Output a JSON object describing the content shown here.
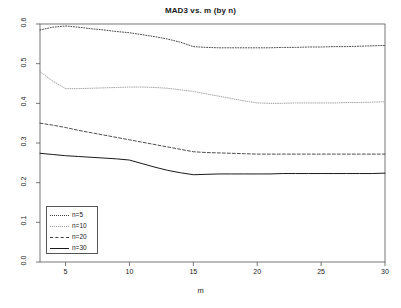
{
  "chart_data": {
    "type": "line",
    "title": "MAD3 vs. m (by n)",
    "xlabel": "m",
    "ylabel": "",
    "xlim": [
      3,
      30
    ],
    "ylim": [
      0.0,
      0.6
    ],
    "grid": false,
    "legend_position": "bottom-left",
    "xticks": [
      "5",
      "10",
      "15",
      "20",
      "25",
      "30"
    ],
    "xtick_values": [
      5,
      10,
      15,
      20,
      25,
      30
    ],
    "yticks": [
      "0.0",
      "0.1",
      "0.2",
      "0.3",
      "0.4",
      "0.5",
      "0.6"
    ],
    "ytick_values": [
      0.0,
      0.1,
      0.2,
      0.3,
      0.4,
      0.5,
      0.6
    ],
    "x": [
      3,
      4,
      5,
      6,
      7,
      8,
      9,
      10,
      11,
      12,
      13,
      14,
      15,
      16,
      17,
      18,
      19,
      20,
      21,
      22,
      23,
      24,
      25,
      26,
      27,
      28,
      29,
      30
    ],
    "series": [
      {
        "name": "n=5",
        "style": "dotted",
        "color": "#3a3a3a",
        "values": [
          0.585,
          0.592,
          0.595,
          0.592,
          0.588,
          0.585,
          0.581,
          0.578,
          0.573,
          0.568,
          0.562,
          0.554,
          0.543,
          0.541,
          0.54,
          0.54,
          0.54,
          0.54,
          0.54,
          0.541,
          0.541,
          0.542,
          0.542,
          0.543,
          0.543,
          0.544,
          0.545,
          0.546
        ]
      },
      {
        "name": "n=10",
        "style": "fine-dotted",
        "color": "#9a9a9a",
        "values": [
          0.48,
          0.456,
          0.437,
          0.437,
          0.438,
          0.439,
          0.44,
          0.441,
          0.441,
          0.44,
          0.438,
          0.434,
          0.43,
          0.424,
          0.418,
          0.412,
          0.406,
          0.401,
          0.4,
          0.4,
          0.401,
          0.401,
          0.401,
          0.401,
          0.402,
          0.402,
          0.403,
          0.404
        ]
      },
      {
        "name": "n=20",
        "style": "dashed",
        "color": "#3a3a3a",
        "values": [
          0.35,
          0.345,
          0.339,
          0.332,
          0.326,
          0.32,
          0.314,
          0.308,
          0.302,
          0.296,
          0.29,
          0.284,
          0.278,
          0.276,
          0.275,
          0.274,
          0.273,
          0.272,
          0.272,
          0.272,
          0.272,
          0.272,
          0.272,
          0.272,
          0.272,
          0.272,
          0.272,
          0.272
        ]
      },
      {
        "name": "n=30",
        "style": "solid",
        "color": "#1a1a1a",
        "values": [
          0.274,
          0.271,
          0.268,
          0.266,
          0.264,
          0.262,
          0.26,
          0.257,
          0.248,
          0.239,
          0.231,
          0.225,
          0.22,
          0.221,
          0.222,
          0.222,
          0.222,
          0.222,
          0.222,
          0.223,
          0.223,
          0.223,
          0.223,
          0.223,
          0.223,
          0.223,
          0.223,
          0.224
        ]
      }
    ]
  },
  "legend": {
    "items": [
      {
        "label": "n=5"
      },
      {
        "label": "n=10"
      },
      {
        "label": "n=20"
      },
      {
        "label": "n=30"
      }
    ]
  }
}
